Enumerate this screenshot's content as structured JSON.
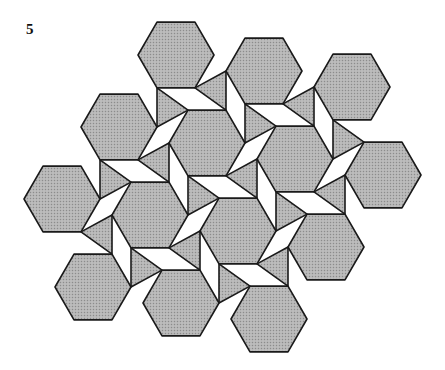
{
  "figure": {
    "label": "5",
    "fill_color": "#b4b4b4",
    "fill_dot_color": "#8c8c8c",
    "stroke_color": "#1a1a1a"
  },
  "lattice": {
    "origin": [
      119,
      127
    ],
    "u": [
      88,
      16
    ],
    "v": [
      31,
      88
    ],
    "hex_radius": 38
  },
  "hexagons": [
    {
      "i": 1,
      "j": -1
    },
    {
      "i": 2,
      "j": -1
    },
    {
      "i": 3,
      "j": -1
    },
    {
      "i": 0,
      "j": 0
    },
    {
      "i": 1,
      "j": 0
    },
    {
      "i": 2,
      "j": 0
    },
    {
      "i": 3,
      "j": 0
    },
    {
      "i": -1,
      "j": 1
    },
    {
      "i": 0,
      "j": 1
    },
    {
      "i": 1,
      "j": 1
    },
    {
      "i": 2,
      "j": 1
    },
    {
      "i": -1,
      "j": 2
    },
    {
      "i": 0,
      "j": 2
    },
    {
      "i": 1,
      "j": 2
    }
  ],
  "triangles": [
    {
      "corners": [
        [
          0,
          0,
          0
        ],
        [
          1,
          -1,
          2
        ],
        [
          1,
          0,
          4
        ]
      ]
    },
    {
      "corners": [
        [
          1,
          0,
          0
        ],
        [
          2,
          -1,
          2
        ],
        [
          2,
          0,
          4
        ]
      ]
    },
    {
      "corners": [
        [
          2,
          0,
          0
        ],
        [
          3,
          -1,
          2
        ],
        [
          3,
          0,
          4
        ]
      ]
    },
    {
      "corners": [
        [
          -1,
          1,
          0
        ],
        [
          0,
          0,
          2
        ],
        [
          0,
          1,
          4
        ]
      ]
    },
    {
      "corners": [
        [
          0,
          1,
          0
        ],
        [
          1,
          0,
          2
        ],
        [
          1,
          1,
          4
        ]
      ]
    },
    {
      "corners": [
        [
          1,
          1,
          0
        ],
        [
          2,
          0,
          2
        ],
        [
          2,
          1,
          4
        ]
      ]
    },
    {
      "corners": [
        [
          -1,
          2,
          0
        ],
        [
          0,
          1,
          2
        ],
        [
          0,
          2,
          4
        ]
      ]
    },
    {
      "corners": [
        [
          0,
          2,
          0
        ],
        [
          1,
          1,
          2
        ],
        [
          1,
          2,
          4
        ]
      ]
    },
    {
      "corners": [
        [
          1,
          -1,
          1
        ],
        [
          2,
          -1,
          3
        ],
        [
          1,
          0,
          5
        ]
      ]
    },
    {
      "corners": [
        [
          2,
          -1,
          1
        ],
        [
          3,
          -1,
          3
        ],
        [
          2,
          0,
          5
        ]
      ]
    },
    {
      "corners": [
        [
          0,
          0,
          1
        ],
        [
          1,
          0,
          3
        ],
        [
          0,
          1,
          5
        ]
      ]
    },
    {
      "corners": [
        [
          1,
          0,
          1
        ],
        [
          2,
          0,
          3
        ],
        [
          1,
          1,
          5
        ]
      ]
    },
    {
      "corners": [
        [
          2,
          0,
          1
        ],
        [
          3,
          0,
          3
        ],
        [
          2,
          1,
          5
        ]
      ]
    },
    {
      "corners": [
        [
          -1,
          1,
          1
        ],
        [
          0,
          1,
          3
        ],
        [
          -1,
          2,
          5
        ]
      ]
    },
    {
      "corners": [
        [
          0,
          1,
          1
        ],
        [
          1,
          1,
          3
        ],
        [
          0,
          2,
          5
        ]
      ]
    },
    {
      "corners": [
        [
          1,
          1,
          1
        ],
        [
          2,
          1,
          3
        ],
        [
          1,
          2,
          5
        ]
      ]
    }
  ]
}
